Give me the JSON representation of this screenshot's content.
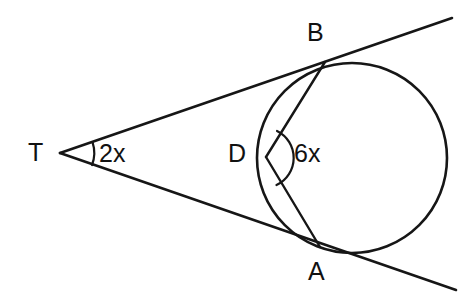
{
  "figure": {
    "kind": "geometry-diagram",
    "background_color": "#ffffff",
    "stroke_color": "#161616"
  },
  "points": {
    "T": {
      "label": "T",
      "x": 60,
      "y": 153
    },
    "B": {
      "label": "B",
      "x": 325,
      "y": 62
    },
    "A": {
      "label": "A",
      "x": 320,
      "y": 247
    },
    "D": {
      "label": "D",
      "x": 266,
      "y": 157
    }
  },
  "circle": {
    "name": "main-circle",
    "center_x": 352,
    "center_y": 158,
    "radius": 95
  },
  "angles": {
    "at_T": {
      "label": "2x",
      "vertex": "T",
      "value_expression": "2x"
    },
    "at_D": {
      "label": "6x",
      "vertex": "D",
      "value_expression": "6x"
    }
  },
  "segments": [
    {
      "name": "tangent-upper",
      "from": "T",
      "through": "B",
      "extends_to_x": 452,
      "extends_to_y": 18
    },
    {
      "name": "tangent-lower",
      "from": "T",
      "through": "A",
      "extends_to_x": 456,
      "extends_to_y": 290
    },
    {
      "name": "chord-BD",
      "from": "B",
      "to": "D"
    },
    {
      "name": "chord-AD",
      "from": "A",
      "to": "D"
    }
  ]
}
